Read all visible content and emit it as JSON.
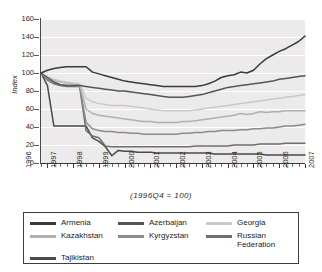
{
  "chart_data": {
    "type": "line",
    "title": "",
    "subtitle": "",
    "xlabel": "(1996Q4  =  100)",
    "ylabel": "Index",
    "ylim": [
      0,
      160
    ],
    "yticks": [
      0,
      20,
      40,
      60,
      80,
      100,
      120,
      140,
      160
    ],
    "xlim": [
      1996.75,
      2007.0
    ],
    "xticks": [
      1996,
      1997,
      1998,
      1999,
      2000,
      2001,
      2002,
      2003,
      2004,
      2005,
      2006,
      2007
    ],
    "xtick_labels": [
      "1996",
      "1997",
      "1998",
      "1999",
      "2000",
      "2001",
      "2002",
      "2003",
      "2004",
      "2005",
      "2006",
      "2007"
    ],
    "grid": "horizontal-white-on-gray",
    "legend_position": "below-plot-boxed",
    "x": [
      1996.75,
      1997.0,
      1997.25,
      1997.5,
      1997.75,
      1998.0,
      1998.25,
      1998.5,
      1998.75,
      1999.0,
      1999.25,
      1999.5,
      1999.75,
      2000.0,
      2000.25,
      2000.5,
      2000.75,
      2001.0,
      2001.25,
      2001.5,
      2001.75,
      2002.0,
      2002.25,
      2002.5,
      2002.75,
      2003.0,
      2003.25,
      2003.5,
      2003.75,
      2004.0,
      2004.25,
      2004.5,
      2004.75,
      2005.0,
      2005.25,
      2005.5,
      2005.75,
      2006.0,
      2006.25,
      2006.5,
      2006.75,
      2007.0
    ],
    "series": [
      {
        "name": "Armenia",
        "color": "#3a3a3a",
        "values": [
          100,
          103,
          105,
          106,
          107,
          107,
          107,
          107,
          101,
          99,
          97,
          95,
          93,
          91,
          90,
          89,
          88,
          87,
          86,
          85,
          85,
          85,
          85,
          85,
          85,
          86,
          88,
          91,
          95,
          97,
          98,
          101,
          100,
          103,
          110,
          116,
          120,
          124,
          127,
          131,
          135,
          141
        ]
      },
      {
        "name": "Azerbaijan",
        "color": "#555555",
        "values": [
          100,
          95,
          90,
          87,
          86,
          86,
          86,
          85,
          84,
          83,
          82,
          81,
          80,
          80,
          79,
          78,
          77,
          76,
          75,
          74,
          73,
          73,
          73,
          74,
          75,
          76,
          78,
          80,
          82,
          84,
          85,
          86,
          87,
          88,
          89,
          90,
          91,
          93,
          94,
          95,
          96,
          97
        ]
      },
      {
        "name": "Georgia",
        "color": "#c9c9c9",
        "values": [
          100,
          96,
          93,
          91,
          90,
          89,
          88,
          72,
          68,
          66,
          65,
          64,
          64,
          64,
          63,
          62,
          61,
          60,
          59,
          58,
          58,
          58,
          58,
          58,
          59,
          60,
          61,
          62,
          63,
          64,
          65,
          66,
          67,
          68,
          69,
          70,
          71,
          72,
          73,
          74,
          75,
          76
        ]
      },
      {
        "name": "Kazakhstan",
        "color": "#b0b0b0",
        "values": [
          100,
          95,
          92,
          90,
          89,
          88,
          87,
          60,
          55,
          53,
          52,
          51,
          50,
          49,
          48,
          47,
          46,
          46,
          45,
          45,
          45,
          45,
          46,
          46,
          47,
          48,
          49,
          50,
          51,
          52,
          53,
          55,
          54,
          55,
          57,
          56,
          57,
          57,
          58,
          58,
          58,
          58
        ]
      },
      {
        "name": "Kyrgyzstan",
        "color": "#8a8a8a",
        "values": [
          100,
          93,
          89,
          87,
          86,
          86,
          85,
          45,
          38,
          36,
          35,
          35,
          34,
          34,
          33,
          33,
          32,
          32,
          32,
          32,
          32,
          32,
          33,
          33,
          34,
          34,
          35,
          35,
          36,
          36,
          36,
          37,
          37,
          38,
          38,
          39,
          39,
          40,
          41,
          41,
          42,
          43
        ]
      },
      {
        "name": "Russian Federation",
        "color": "#6e6e6e",
        "values": [
          100,
          92,
          88,
          86,
          85,
          85,
          85,
          36,
          30,
          28,
          19,
          18,
          18,
          18,
          18,
          18,
          18,
          18,
          18,
          18,
          18,
          18,
          18,
          18,
          19,
          19,
          19,
          19,
          19,
          19,
          20,
          20,
          20,
          20,
          21,
          21,
          21,
          21,
          22,
          22,
          22,
          22
        ]
      },
      {
        "name": "Tajikistan",
        "color": "#4a4a4a",
        "values": [
          100,
          86,
          41,
          41,
          41,
          41,
          41,
          41,
          28,
          24,
          18,
          8,
          14,
          13,
          13,
          12,
          12,
          12,
          11,
          11,
          11,
          11,
          11,
          11,
          11,
          11,
          11,
          10,
          10,
          10,
          10,
          10,
          10,
          10,
          10,
          9,
          9,
          9,
          9,
          9,
          9,
          9
        ]
      }
    ]
  },
  "legend": {
    "rows": [
      [
        {
          "label": "Armenia",
          "color": "#3a3a3a"
        },
        {
          "label": "Azerbaijan",
          "color": "#555555"
        },
        {
          "label": "Georgia",
          "color": "#c9c9c9"
        }
      ],
      [
        {
          "label": "Kazakhstan",
          "color": "#b0b0b0"
        },
        {
          "label": "Kyrgyzstan",
          "color": "#8a8a8a"
        },
        {
          "label": "Russian\nFederation",
          "color": "#6e6e6e"
        }
      ],
      [
        {
          "label": "Tajikistan",
          "color": "#4a4a4a"
        }
      ]
    ]
  }
}
